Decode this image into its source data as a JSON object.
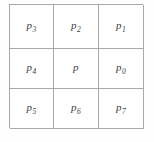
{
  "figure": {
    "name": "pixel-8-neighborhood-grid",
    "rows": 3,
    "columns": 3,
    "border_color": "#a9a9a9",
    "background_color": "#ffffff",
    "text_color": "#3d3d3d",
    "cells": [
      {
        "symbol": "p",
        "subscript": "3",
        "row": 1,
        "column": 1
      },
      {
        "symbol": "p",
        "subscript": "2",
        "row": 1,
        "column": 2
      },
      {
        "symbol": "p",
        "subscript": "1",
        "row": 1,
        "column": 3
      },
      {
        "symbol": "p",
        "subscript": "4",
        "row": 2,
        "column": 1
      },
      {
        "symbol": "p",
        "subscript": "",
        "row": 2,
        "column": 2
      },
      {
        "symbol": "p",
        "subscript": "0",
        "row": 2,
        "column": 3
      },
      {
        "symbol": "p",
        "subscript": "5",
        "row": 3,
        "column": 1
      },
      {
        "symbol": "p",
        "subscript": "6",
        "row": 3,
        "column": 2
      },
      {
        "symbol": "p",
        "subscript": "7",
        "row": 3,
        "column": 3
      }
    ]
  }
}
